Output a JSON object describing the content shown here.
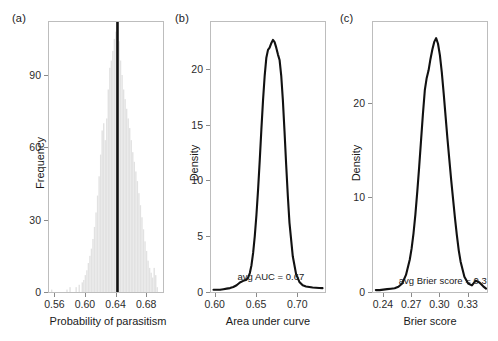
{
  "figure": {
    "panels": [
      {
        "label": "(a)",
        "xlabel": "Probability of parasitism",
        "ylabel": "Frequency"
      },
      {
        "label": "(b)",
        "xlabel": "Area under curve",
        "ylabel": "Density",
        "annotation": "avg AUC = 0.67"
      },
      {
        "label": "(c)",
        "xlabel": "Brier score",
        "ylabel": "Density",
        "annotation": "avg Brier score = 0.3"
      }
    ]
  },
  "chart_data": [
    {
      "type": "bar",
      "panel": "(a)",
      "title": "",
      "xlabel": "Probability of parasitism",
      "ylabel": "Frequency",
      "xlim": [
        0.553,
        0.702
      ],
      "ylim": [
        0,
        112
      ],
      "xticks": [
        0.56,
        0.6,
        0.64,
        0.68
      ],
      "xtick_labels": [
        "0.56",
        "0.60",
        "0.64",
        "0.68"
      ],
      "yticks": [
        0,
        30,
        60,
        90
      ],
      "ytick_labels": [
        "0",
        "30",
        "60",
        "90"
      ],
      "grid": false,
      "bar_color": "#e2e2e2",
      "bar_width": 0.0016,
      "vline": {
        "x": 0.6425,
        "color": "#111111",
        "width_px": 2.6,
        "label": "observed mean probability of parasitism"
      },
      "x": [
        0.5565,
        0.5765,
        0.5805,
        0.5885,
        0.5925,
        0.5965,
        0.5985,
        0.6005,
        0.6025,
        0.6045,
        0.6065,
        0.6085,
        0.6105,
        0.6125,
        0.6145,
        0.6165,
        0.6185,
        0.6205,
        0.6225,
        0.6245,
        0.6265,
        0.6285,
        0.6305,
        0.6325,
        0.6345,
        0.6365,
        0.6385,
        0.6405,
        0.6425,
        0.6445,
        0.6465,
        0.6485,
        0.6505,
        0.6525,
        0.6545,
        0.6565,
        0.6585,
        0.6605,
        0.6625,
        0.6645,
        0.6665,
        0.6685,
        0.6705,
        0.6725,
        0.6745,
        0.6765,
        0.6785,
        0.6805,
        0.6825,
        0.6845,
        0.6865,
        0.6885,
        0.6905,
        0.6925,
        0.6945
      ],
      "values": [
        1,
        1,
        2,
        2,
        3,
        4,
        5,
        7,
        9,
        12,
        15,
        18,
        22,
        27,
        33,
        40,
        48,
        57,
        67,
        70,
        63,
        72,
        84,
        93,
        96,
        100,
        105,
        108,
        111,
        104,
        96,
        90,
        84,
        80,
        76,
        72,
        68,
        63,
        58,
        54,
        50,
        46,
        41,
        36,
        31,
        26,
        21,
        17,
        13,
        10,
        8,
        6,
        10,
        7,
        2
      ]
    },
    {
      "type": "line",
      "panel": "(b)",
      "title": "",
      "xlabel": "Area under curve",
      "ylabel": "Density",
      "xlim": [
        0.5955,
        0.7335
      ],
      "ylim": [
        0,
        24.2
      ],
      "xticks": [
        0.6,
        0.65,
        0.7
      ],
      "xtick_labels": [
        "0.60",
        "0.65",
        "0.70"
      ],
      "yticks": [
        0,
        5,
        10,
        15,
        20
      ],
      "ytick_labels": [
        "0",
        "5",
        "10",
        "15",
        "20"
      ],
      "grid": false,
      "line_color": "#111111",
      "line_width_px": 2.1,
      "annotation": "avg AUC = 0.67",
      "annotation_xy": [
        0.668,
        1.35
      ],
      "x": [
        0.5985,
        0.6025,
        0.6065,
        0.6105,
        0.6145,
        0.6185,
        0.6225,
        0.6265,
        0.6305,
        0.6345,
        0.6385,
        0.6405,
        0.6425,
        0.6445,
        0.6465,
        0.6485,
        0.6505,
        0.6525,
        0.6545,
        0.6565,
        0.6585,
        0.6605,
        0.6625,
        0.6645,
        0.6665,
        0.6685,
        0.6705,
        0.6725,
        0.6745,
        0.6765,
        0.6785,
        0.6805,
        0.6825,
        0.6845,
        0.6865,
        0.6885,
        0.6905,
        0.6945,
        0.6985,
        0.7025,
        0.7065,
        0.7105,
        0.7145,
        0.7185,
        0.7225,
        0.7265,
        0.7305
      ],
      "values": [
        0.2,
        0.2,
        0.2,
        0.25,
        0.3,
        0.35,
        0.45,
        0.6,
        0.85,
        1.0,
        1.1,
        1.3,
        1.7,
        2.4,
        3.5,
        5.0,
        6.9,
        9.2,
        11.8,
        14.6,
        17.2,
        19.4,
        21.0,
        21.7,
        21.9,
        22.3,
        22.6,
        22.4,
        21.9,
        21.3,
        20.8,
        19.4,
        17.2,
        14.4,
        11.4,
        8.6,
        6.2,
        3.2,
        1.6,
        0.9,
        0.6,
        0.5,
        0.45,
        0.4,
        0.38,
        0.36,
        0.35
      ]
    },
    {
      "type": "line",
      "panel": "(c)",
      "title": "",
      "xlabel": "Brier score",
      "ylabel": "Density",
      "xlim": [
        0.2295,
        0.3505
      ],
      "ylim": [
        0,
        28.5
      ],
      "xticks": [
        0.24,
        0.27,
        0.3,
        0.33
      ],
      "xtick_labels": [
        "0.24",
        "0.27",
        "0.30",
        "0.33"
      ],
      "yticks": [
        0,
        10,
        20
      ],
      "ytick_labels": [
        "0",
        "10",
        "20"
      ],
      "grid": false,
      "line_color": "#111111",
      "line_width_px": 2.1,
      "annotation": "avg Brier score = 0.3",
      "annotation_xy": [
        0.3035,
        1.2
      ],
      "x": [
        0.2325,
        0.2365,
        0.2405,
        0.2445,
        0.2485,
        0.2525,
        0.2565,
        0.2605,
        0.2645,
        0.2685,
        0.2705,
        0.2725,
        0.2745,
        0.2765,
        0.2785,
        0.2805,
        0.2825,
        0.2845,
        0.2865,
        0.2885,
        0.2905,
        0.2925,
        0.2945,
        0.2965,
        0.2985,
        0.3005,
        0.3025,
        0.3045,
        0.3065,
        0.3085,
        0.3105,
        0.3125,
        0.3145,
        0.3165,
        0.3185,
        0.3205,
        0.3225,
        0.3265,
        0.3305,
        0.3345,
        0.3385,
        0.3425,
        0.3465,
        0.3495
      ],
      "values": [
        0.2,
        0.2,
        0.25,
        0.3,
        0.35,
        0.4,
        0.55,
        0.9,
        1.8,
        3.4,
        4.6,
        6.2,
        8.2,
        10.6,
        13.2,
        16.0,
        18.8,
        21.3,
        22.6,
        23.4,
        24.6,
        25.6,
        26.4,
        26.8,
        26.2,
        25.0,
        23.2,
        21.0,
        18.6,
        16.2,
        14.0,
        11.8,
        9.8,
        7.8,
        6.0,
        4.4,
        3.2,
        1.6,
        0.9,
        0.7,
        1.2,
        1.0,
        0.6,
        0.35
      ]
    }
  ]
}
